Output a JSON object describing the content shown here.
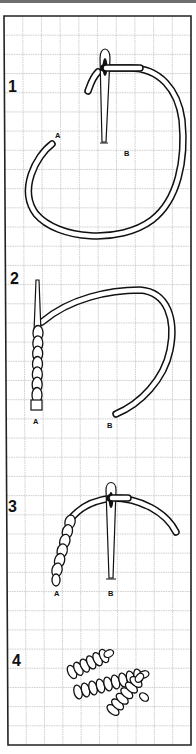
{
  "diagram": {
    "colors": {
      "line": "#111111",
      "grid": "#c4c4c4",
      "paper": "#ffffff",
      "top_bar": "#6e6e6e"
    },
    "grid": {
      "columns": 10,
      "rows": 38
    },
    "steps": [
      {
        "number": "1",
        "point_a": "A",
        "point_b": "B",
        "elements": [
          "needle-with-eye",
          "thread-loop"
        ]
      },
      {
        "number": "2",
        "point_a": "A",
        "point_b": "B",
        "elements": [
          "needle-tip",
          "thread-coils",
          "thread-loop"
        ]
      },
      {
        "number": "3",
        "point_a": "A",
        "point_b": "B",
        "elements": [
          "needle-with-eye",
          "thread-coils",
          "thread-tail"
        ]
      },
      {
        "number": "4",
        "elements": [
          "bullion-knot",
          "bullion-knot",
          "bullion-knot"
        ]
      }
    ]
  }
}
